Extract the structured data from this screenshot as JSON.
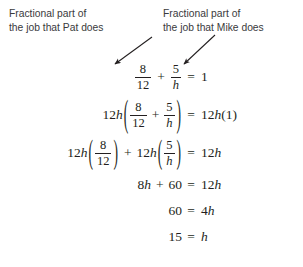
{
  "annotations": {
    "left": {
      "name": "fractional-part-pat",
      "line1": "Fractional part of",
      "line2": "the job that Pat does"
    },
    "right": {
      "name": "fractional-part-mike",
      "line1": "Fractional part of",
      "line2": "the job that Mike does"
    }
  },
  "colors": {
    "text": "#231f20",
    "annotation": "#3a3a3c",
    "background": "#ffffff"
  },
  "equations": [
    {
      "id": "eq-1",
      "plain": "8/12 + 5/h = 1",
      "left": {
        "frac1": {
          "num": "8",
          "den": "12"
        },
        "op": "+",
        "frac2": {
          "num": "5",
          "den": "h"
        }
      },
      "relation": "=",
      "right": {
        "value": "1"
      }
    },
    {
      "id": "eq-2",
      "plain": "12h(8/12 + 5/h) = 12h(1)",
      "left": {
        "coef": "12",
        "coef_var": "h",
        "open": "(",
        "frac1": {
          "num": "8",
          "den": "12"
        },
        "op": "+",
        "frac2": {
          "num": "5",
          "den": "h"
        },
        "close": ")"
      },
      "relation": "=",
      "right": {
        "coef": "12",
        "coef_var": "h",
        "value": "(1)"
      }
    },
    {
      "id": "eq-3",
      "plain": "12h(8/12) + 12h(5/h) = 12h",
      "left": {
        "coef_a": "12",
        "coef_a_var": "h",
        "open_a": "(",
        "frac1": {
          "num": "8",
          "den": "12"
        },
        "close_a": ")",
        "op": "+",
        "coef_b": "12",
        "coef_b_var": "h",
        "open_b": "(",
        "frac2": {
          "num": "5",
          "den": "h"
        },
        "close_b": ")"
      },
      "relation": "=",
      "right": {
        "coef": "12",
        "coef_var": "h"
      }
    },
    {
      "id": "eq-4",
      "plain": "8h + 60 = 12h",
      "left": {
        "term1_coef": "8",
        "term1_var": "h",
        "op": "+",
        "term2": "60"
      },
      "relation": "=",
      "right": {
        "coef": "12",
        "coef_var": "h"
      }
    },
    {
      "id": "eq-5",
      "plain": "60 = 4h",
      "left": {
        "value": "60"
      },
      "relation": "=",
      "right": {
        "coef": "4",
        "coef_var": "h"
      }
    },
    {
      "id": "eq-6",
      "plain": "15 = h",
      "left": {
        "value": "15"
      },
      "relation": "=",
      "right": {
        "coef_var": "h"
      }
    }
  ]
}
